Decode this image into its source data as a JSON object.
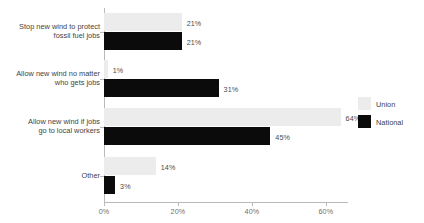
{
  "chart_data": {
    "type": "bar",
    "orientation": "horizontal",
    "title": "",
    "subtitle": "",
    "xlabel": "",
    "ylabel": "",
    "xlim": [
      0,
      66
    ],
    "xticks": [
      "0%",
      "20%",
      "40%",
      "60%"
    ],
    "xtick_values": [
      0,
      20,
      40,
      60
    ],
    "grid": false,
    "legend_position": "right",
    "categories": [
      "Stop new wind to protect\nfossil fuel jobs",
      "Allow new wind no matter\nwho gets jobs",
      "Allow new wind if jobs\ngo to local workers",
      "Other"
    ],
    "series": [
      {
        "name": "Union",
        "color": "#ececec",
        "values": [
          21,
          1,
          64,
          14
        ],
        "labels": [
          "21%",
          "1%",
          "64%",
          "14%"
        ]
      },
      {
        "name": "National",
        "color": "#0b0b0b",
        "values": [
          21,
          31,
          45,
          3
        ],
        "labels": [
          "21%",
          "31%",
          "45%",
          "3%"
        ]
      }
    ]
  },
  "legend": {
    "items": [
      {
        "label": "Union",
        "color": "#ececec"
      },
      {
        "label": "National",
        "color": "#0b0b0b"
      }
    ]
  },
  "axis": {
    "tick_labels": [
      "0%",
      "20%",
      "40%",
      "60%"
    ]
  },
  "colors": {
    "union": "#ececec",
    "national": "#0b0b0b",
    "axis": "#b9b9b9",
    "text": "#3f3f3f",
    "value_text": "#4a4a4a",
    "background": "#ffffff"
  }
}
